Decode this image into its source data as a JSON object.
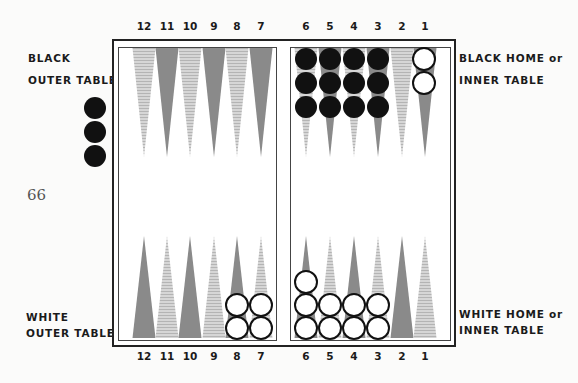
{
  "page_number": "66",
  "labels": {
    "black_outer": [
      "BLACK",
      "OUTER TABLE"
    ],
    "black_home": [
      "BLACK HOME or",
      "INNER TABLE"
    ],
    "white_outer": [
      "WHITE",
      "OUTER TABLE"
    ],
    "white_home": [
      "WHITE HOME or",
      "INNER TABLE"
    ]
  },
  "point_numbers": {
    "top": [
      "12",
      "11",
      "10",
      "9",
      "8",
      "7",
      "6",
      "5",
      "4",
      "3",
      "2",
      "1"
    ],
    "bottom": [
      "12",
      "11",
      "10",
      "9",
      "8",
      "7",
      "6",
      "5",
      "4",
      "3",
      "2",
      "1"
    ]
  },
  "colors": {
    "dark_point": "#8a8a8a",
    "light_point": "#c8c8c8",
    "black_checker": "#111111",
    "white_checker": "#ffffff",
    "frame": "#222222"
  },
  "checkers": {
    "off_board_black": 3,
    "top": {
      "6": {
        "color": "black",
        "count": 3
      },
      "5": {
        "color": "black",
        "count": 3
      },
      "4": {
        "color": "black",
        "count": 3
      },
      "3": {
        "color": "black",
        "count": 3
      },
      "1": {
        "color": "white",
        "count": 2
      }
    },
    "bottom": {
      "8": {
        "color": "white",
        "count": 2
      },
      "7": {
        "color": "white",
        "count": 2
      },
      "6": {
        "color": "white",
        "count": 3
      },
      "5": {
        "color": "white",
        "count": 2
      },
      "4": {
        "color": "white",
        "count": 2
      },
      "3": {
        "color": "white",
        "count": 2
      }
    }
  }
}
